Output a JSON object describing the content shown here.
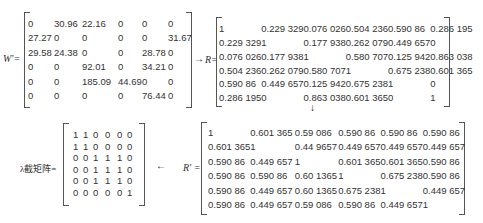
{
  "labels": {
    "W": "W'=",
    "R": "R=",
    "Rprime": "R' =",
    "lambda": "λ截矩阵="
  },
  "arrows": {
    "right": "→",
    "down": "↓",
    "left": "←"
  },
  "W": [
    [
      "0",
      "30.96",
      "22.16",
      "0",
      "0",
      "0"
    ],
    [
      "27.27",
      "0",
      "0",
      "0",
      "0",
      "31.67"
    ],
    [
      "29.58",
      "24.38",
      "0",
      "0",
      "28.78",
      "0"
    ],
    [
      "0",
      "0",
      "92.01",
      "0",
      "34.21",
      "0"
    ],
    [
      "0",
      "0",
      "185.09",
      "44.69",
      "0",
      "0"
    ],
    [
      "0",
      "0",
      "0",
      "0",
      "76.44",
      "0"
    ]
  ],
  "R": [
    [
      "1",
      "0.229 329",
      "0.076 026",
      "0.504 236",
      "0.590 86",
      "0.286 195"
    ],
    [
      "0.229 329",
      "1",
      "0.177 938",
      "0.262 079",
      "0.449 657",
      "0"
    ],
    [
      "0.076 026",
      "0.177 938",
      "1",
      "0.580 707",
      "0.125 942",
      "0.863 038"
    ],
    [
      "0.504 236",
      "0.262 079",
      "0.580 707",
      "1",
      "0.675 238",
      "0.601 365"
    ],
    [
      "0.590 86",
      "0.449 657",
      "0.125 942",
      "0.675 238",
      "1",
      "0"
    ],
    [
      "0.286 195",
      "0",
      "0.863 038",
      "0.601 365",
      "0",
      "1"
    ]
  ],
  "Rprime": [
    [
      "1",
      "0.601 365",
      "0.59 086",
      "0.590 86",
      "0.590 86",
      "0.590 86"
    ],
    [
      "0.601 365",
      "1",
      "0.44 9657",
      "0.449 657",
      "0.449 657",
      "0.449 657"
    ],
    [
      "0.590 86",
      "0.449 657",
      "1",
      "0.601 365",
      "0.601 365",
      "0.590 86"
    ],
    [
      "0.590 86",
      "0.590 86",
      "0.60 1365",
      "1",
      "0.675 238",
      "0.590 86"
    ],
    [
      "0.590 86",
      "0.449 657",
      "0.60 1365",
      "0.675 238",
      "1",
      "0.449 657"
    ],
    [
      "0.590 86",
      "0.449 657",
      "0.59 086",
      "0.590 86",
      "0.449 657",
      "1"
    ]
  ],
  "lambda": [
    [
      "1",
      "1",
      "0",
      "0",
      "0",
      "0"
    ],
    [
      "1",
      "1",
      "0",
      "0",
      "0",
      "0"
    ],
    [
      "0",
      "0",
      "1",
      "1",
      "1",
      "0"
    ],
    [
      "0",
      "0",
      "1",
      "1",
      "1",
      "0"
    ],
    [
      "0",
      "0",
      "1",
      "1",
      "1",
      "0"
    ],
    [
      "0",
      "0",
      "0",
      "0",
      "0",
      "1"
    ]
  ]
}
